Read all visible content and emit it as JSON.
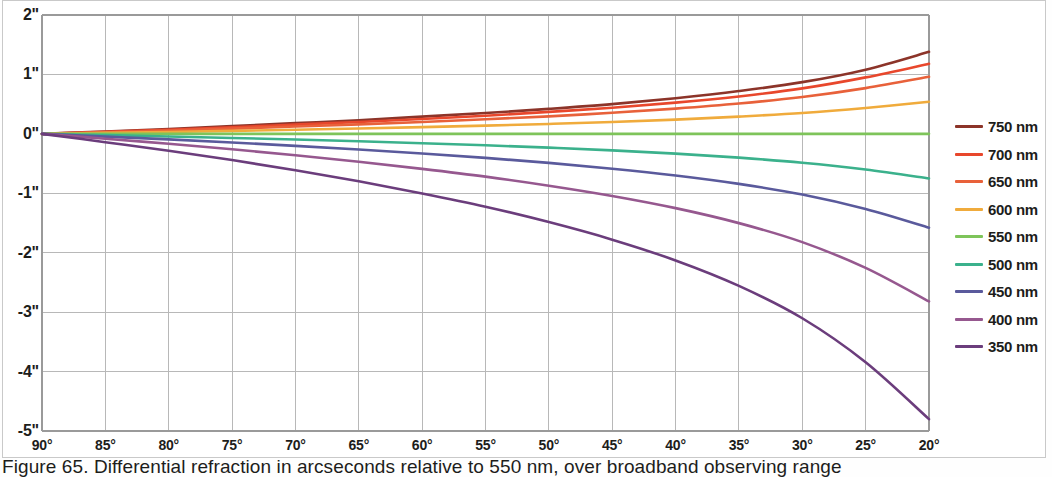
{
  "figure": {
    "caption": "Figure 65.  Differential refraction in arcseconds relative to 550 nm, over broadband observing range"
  },
  "chart_data": {
    "type": "line",
    "title": "",
    "xlabel": "",
    "ylabel": "",
    "x": [
      90,
      85,
      80,
      75,
      70,
      65,
      60,
      55,
      50,
      45,
      40,
      35,
      30,
      25,
      20
    ],
    "x_tick_labels": [
      "90°",
      "85°",
      "80°",
      "75°",
      "70°",
      "65°",
      "60°",
      "55°",
      "50°",
      "45°",
      "40°",
      "35°",
      "30°",
      "25°",
      "20°"
    ],
    "y_ticks": [
      2,
      1,
      0,
      -1,
      -2,
      -3,
      -4,
      -5
    ],
    "y_tick_labels": [
      "2\"",
      "1\"",
      "0\"",
      "-1\"",
      "-2\"",
      "-3\"",
      "-4\"",
      "-5\""
    ],
    "xlim": [
      90,
      20
    ],
    "ylim": [
      -5,
      2
    ],
    "grid": true,
    "legend_position": "right",
    "series": [
      {
        "name": "750 nm",
        "color": "#8c3429",
        "values": [
          0.0,
          0.04,
          0.08,
          0.13,
          0.18,
          0.23,
          0.29,
          0.35,
          0.42,
          0.5,
          0.6,
          0.72,
          0.87,
          1.08,
          1.38
        ]
      },
      {
        "name": "700 nm",
        "color": "#e8472c",
        "values": [
          0.0,
          0.035,
          0.07,
          0.11,
          0.155,
          0.2,
          0.25,
          0.305,
          0.37,
          0.44,
          0.525,
          0.63,
          0.765,
          0.95,
          1.18
        ]
      },
      {
        "name": "650 nm",
        "color": "#e8613a",
        "values": [
          0.0,
          0.028,
          0.056,
          0.088,
          0.123,
          0.16,
          0.2,
          0.245,
          0.295,
          0.355,
          0.425,
          0.51,
          0.62,
          0.77,
          0.96
        ]
      },
      {
        "name": "600 nm",
        "color": "#f0ab3c",
        "values": [
          0.0,
          0.016,
          0.032,
          0.05,
          0.07,
          0.09,
          0.113,
          0.138,
          0.167,
          0.2,
          0.24,
          0.29,
          0.35,
          0.435,
          0.54
        ]
      },
      {
        "name": "550 nm",
        "color": "#7ec45a",
        "values": [
          0.0,
          0.0,
          0.0,
          0.0,
          0.0,
          0.0,
          0.0,
          0.0,
          0.0,
          0.0,
          0.0,
          0.0,
          0.0,
          0.0,
          0.0
        ]
      },
      {
        "name": "500 nm",
        "color": "#3bb18c",
        "values": [
          0.0,
          -0.022,
          -0.044,
          -0.069,
          -0.096,
          -0.125,
          -0.157,
          -0.192,
          -0.232,
          -0.278,
          -0.333,
          -0.4,
          -0.485,
          -0.6,
          -0.75
        ]
      },
      {
        "name": "450 nm",
        "color": "#5a5a9c",
        "values": [
          0.0,
          -0.046,
          -0.093,
          -0.145,
          -0.202,
          -0.263,
          -0.33,
          -0.404,
          -0.489,
          -0.586,
          -0.701,
          -0.842,
          -1.021,
          -1.265,
          -1.58
        ]
      },
      {
        "name": "400 nm",
        "color": "#96588f",
        "values": [
          0.0,
          -0.082,
          -0.166,
          -0.259,
          -0.36,
          -0.469,
          -0.589,
          -0.72,
          -0.872,
          -1.045,
          -1.25,
          -1.502,
          -1.822,
          -2.256,
          -2.82
        ]
      },
      {
        "name": "350 nm",
        "color": "#6b3d7c",
        "values": [
          0.0,
          -0.14,
          -0.283,
          -0.441,
          -0.613,
          -0.799,
          -1.003,
          -1.226,
          -1.485,
          -1.78,
          -2.13,
          -2.558,
          -3.103,
          -3.843,
          -4.8
        ]
      }
    ]
  }
}
